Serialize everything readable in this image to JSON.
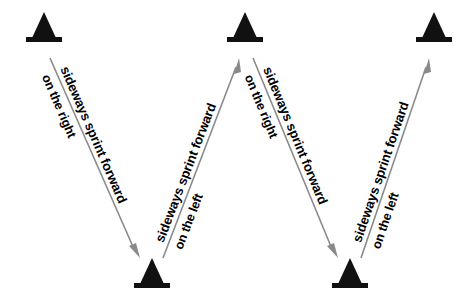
{
  "diagram": {
    "background_color": "#ffffff",
    "cone_color": "#111111",
    "arrow_color": "#8a8a8a",
    "text_color": "#000000",
    "cones": [
      {
        "id": "cone-top-1",
        "label": "cone",
        "x": 44,
        "y": 28,
        "position": "top-left"
      },
      {
        "id": "cone-top-2",
        "label": "cone",
        "x": 245,
        "y": 28,
        "position": "top-middle"
      },
      {
        "id": "cone-top-3",
        "label": "cone",
        "x": 434,
        "y": 28,
        "position": "top-right"
      },
      {
        "id": "cone-bottom-1",
        "label": "cone",
        "x": 152,
        "y": 274,
        "position": "bottom-left"
      },
      {
        "id": "cone-bottom-2",
        "label": "cone",
        "x": 350,
        "y": 274,
        "position": "bottom-right"
      }
    ],
    "routes": [
      {
        "id": "route-1",
        "direction": "down-right",
        "line1": "sideways sprint forward",
        "line2": "on the right",
        "x1": 50,
        "y1": 58,
        "x2": 140,
        "y2": 258
      },
      {
        "id": "route-2",
        "direction": "up-right",
        "line1": "sideways sprint forward",
        "line2": "on the left",
        "x1": 163,
        "y1": 258,
        "x2": 239,
        "y2": 58
      },
      {
        "id": "route-3",
        "direction": "down-right",
        "line1": "sideways sprint forward",
        "line2": "on the right",
        "x1": 253,
        "y1": 58,
        "x2": 338,
        "y2": 258
      },
      {
        "id": "route-4",
        "direction": "up-right",
        "line1": "sideways sprint forward",
        "line2": "on the left",
        "x1": 361,
        "y1": 258,
        "x2": 429,
        "y2": 58
      }
    ]
  }
}
